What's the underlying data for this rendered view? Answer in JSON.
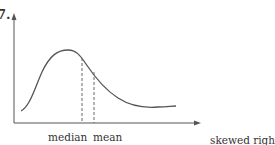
{
  "problem_number": "7.",
  "labels": {
    "median": "median",
    "mean": "mean",
    "caption": "skewed right"
  },
  "figure": {
    "type": "distribution-curve",
    "axes": {
      "x_arrow": true,
      "y_arrow": true
    }
  }
}
